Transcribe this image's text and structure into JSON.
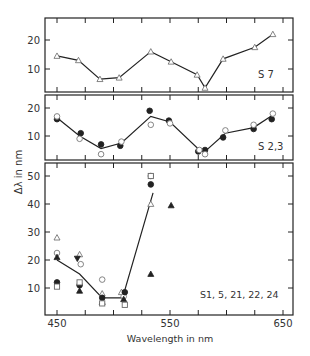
{
  "chart_data": [
    {
      "type": "line",
      "panel": "top",
      "label": "S 7",
      "xlabel": "Wavelength in nm",
      "ylabel": "Δλ in nm",
      "xlim": [
        440,
        655
      ],
      "ylim": [
        0,
        27
      ],
      "yticks": [
        10,
        20
      ],
      "series": [
        {
          "name": "S7",
          "marker": "open-triangle",
          "line": true,
          "x": [
            450,
            469,
            488,
            505,
            533,
            551,
            574,
            581,
            597,
            625,
            641
          ],
          "y": [
            14.5,
            13,
            6.5,
            7,
            16,
            12.5,
            8,
            3.5,
            13.5,
            17.5,
            22
          ]
        }
      ]
    },
    {
      "type": "line",
      "panel": "middle",
      "label": "S 2,3",
      "ylim": [
        0,
        24
      ],
      "yticks": [
        10,
        20
      ],
      "series": [
        {
          "name": "S2 (filled circles)",
          "marker": "filled-circle",
          "x": [
            450,
            471,
            489,
            506,
            532,
            549,
            575,
            581,
            597,
            624,
            640
          ],
          "y": [
            16,
            11,
            7,
            6.5,
            19,
            15.5,
            4.5,
            5,
            9.5,
            12.5,
            16
          ]
        },
        {
          "name": "S3 (open circles)",
          "marker": "open-circle",
          "x": [
            450,
            470,
            489,
            507,
            533,
            550,
            576,
            581,
            599,
            624,
            641
          ],
          "y": [
            17,
            9,
            3.5,
            8,
            14,
            14.5,
            5,
            3.5,
            12,
            14,
            18
          ]
        },
        {
          "name": "mean",
          "marker": "none",
          "line": true,
          "x": [
            450,
            470,
            489,
            507,
            533,
            550,
            576,
            581,
            599,
            624,
            641
          ],
          "y": [
            16.5,
            10,
            5.5,
            7.5,
            17,
            15,
            5,
            4.5,
            11,
            13,
            17.5
          ]
        }
      ]
    },
    {
      "type": "scatter",
      "panel": "bottom",
      "label": "S1, 5, 21, 22, 24",
      "ylim": [
        0,
        55
      ],
      "yticks": [
        10,
        20,
        30,
        40,
        50
      ],
      "xticks": [
        450,
        550,
        650
      ],
      "series": [
        {
          "name": "open triangle",
          "marker": "open-triangle",
          "x": [
            450,
            470,
            490,
            507,
            533
          ],
          "y": [
            28,
            22,
            8,
            8.5,
            40
          ]
        },
        {
          "name": "open circle",
          "marker": "open-circle",
          "x": [
            450,
            471,
            490,
            509,
            533
          ],
          "y": [
            22.5,
            18.5,
            13,
            7,
            50
          ]
        },
        {
          "name": "filled triangle",
          "marker": "filled-triangle",
          "x": [
            450,
            470,
            490,
            509,
            533,
            551
          ],
          "y": [
            21,
            9,
            5,
            6,
            15,
            39.5
          ]
        },
        {
          "name": "inverted filled triangle",
          "marker": "filled-triangle-down",
          "x": [
            468
          ],
          "y": [
            20.5
          ]
        },
        {
          "name": "filled circle",
          "marker": "filled-circle",
          "x": [
            450,
            470,
            490,
            510,
            533
          ],
          "y": [
            12,
            11,
            6.5,
            8.5,
            47
          ]
        },
        {
          "name": "open square",
          "marker": "open-square",
          "x": [
            450,
            470,
            490,
            510,
            533
          ],
          "y": [
            10.5,
            12,
            4.5,
            4,
            50
          ]
        },
        {
          "name": "mean",
          "marker": "none",
          "line": true,
          "x": [
            450,
            470,
            490,
            508,
            535
          ],
          "y": [
            20,
            15,
            6.5,
            6.5,
            44
          ]
        }
      ]
    }
  ],
  "labels": {
    "panel_top": "S 7",
    "panel_middle": "S 2,3",
    "panel_bottom": "S1, 5, 21, 22, 24",
    "xlabel": "Wavelength in nm",
    "ylabel": "Δλ in nm",
    "xticks": [
      "450",
      "550",
      "650"
    ],
    "top_yticks": [
      "20",
      "10"
    ],
    "middle_yticks": [
      "20",
      "10"
    ],
    "bottom_yticks": [
      "50",
      "40",
      "30",
      "20",
      "10"
    ]
  }
}
